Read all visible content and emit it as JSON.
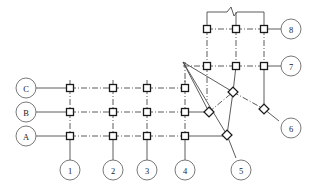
{
  "diagram": {
    "type": "architectural-grid-axis-diagram",
    "colors": {
      "line": "#4a4a4a",
      "node_stroke": "#1a1a1a",
      "node_fill": "#ffffff",
      "circle_stroke": "#6a6a6a",
      "text": "#1a1a1a",
      "background": "#ffffff"
    },
    "line_styles": {
      "grid_primary": "solid",
      "grid_secondary": "dash-dot"
    },
    "axis_labels": {
      "left": [
        {
          "label": "C",
          "y": 88
        },
        {
          "label": "B",
          "y": 112
        },
        {
          "label": "A",
          "y": 136
        }
      ],
      "bottom": [
        {
          "label": "1",
          "x": 70
        },
        {
          "label": "2",
          "x": 113
        },
        {
          "label": "3",
          "x": 147
        },
        {
          "label": "4",
          "x": 185
        },
        {
          "label": "5",
          "x": 241
        }
      ],
      "right": [
        {
          "label": "8",
          "y": 29
        },
        {
          "label": "7",
          "y": 66
        },
        {
          "label": "6",
          "y": 128
        }
      ]
    },
    "columns_orthogonal": [
      70,
      113,
      147,
      185
    ],
    "rows_orthogonal": [
      88,
      112,
      136
    ],
    "columns_upper": [
      207,
      236,
      264
    ],
    "rows_upper": [
      29,
      66
    ],
    "fan_vertex": {
      "x": 183,
      "y": 62
    },
    "square_nodes": [
      {
        "x": 70,
        "y": 88
      },
      {
        "x": 113,
        "y": 88
      },
      {
        "x": 147,
        "y": 88
      },
      {
        "x": 185,
        "y": 88
      },
      {
        "x": 70,
        "y": 112
      },
      {
        "x": 113,
        "y": 112
      },
      {
        "x": 147,
        "y": 112
      },
      {
        "x": 185,
        "y": 112
      },
      {
        "x": 70,
        "y": 136
      },
      {
        "x": 113,
        "y": 136
      },
      {
        "x": 147,
        "y": 136
      },
      {
        "x": 185,
        "y": 136
      },
      {
        "x": 207,
        "y": 29
      },
      {
        "x": 236,
        "y": 29
      },
      {
        "x": 264,
        "y": 29
      },
      {
        "x": 207,
        "y": 66
      },
      {
        "x": 236,
        "y": 66
      },
      {
        "x": 264,
        "y": 66
      }
    ],
    "diamond_nodes": [
      {
        "x": 233,
        "y": 92
      },
      {
        "x": 209,
        "y": 112
      },
      {
        "x": 227,
        "y": 135
      },
      {
        "x": 264,
        "y": 109
      }
    ],
    "break_symbol": {
      "x": 232,
      "y": 12,
      "shape": "zigzag-break"
    },
    "node_size": 7,
    "circle_radius": 10
  }
}
